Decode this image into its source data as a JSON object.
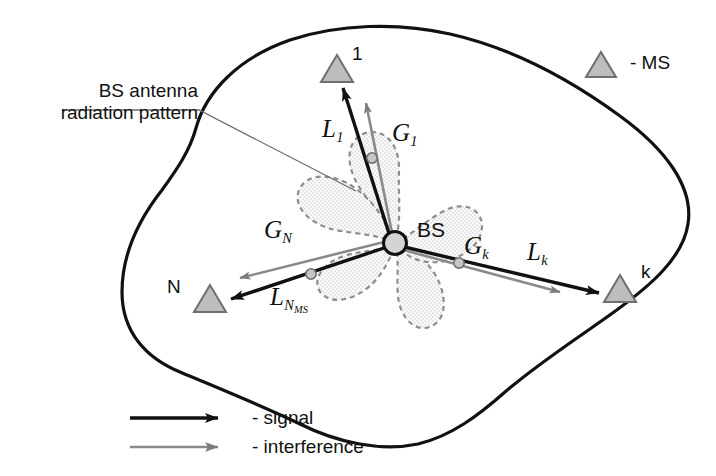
{
  "figure": {
    "background_color": "#ffffff",
    "line_color": "#111111",
    "gray_color": "#808080",
    "fill_gray": "#bdbdbd",
    "pattern_fill": "#f2f2f2"
  },
  "callout": {
    "line1": "BS antenna",
    "line2": "radiation pattern"
  },
  "base_station": {
    "label": "BS",
    "x": 395,
    "y": 243,
    "radius": 11
  },
  "mobile_stations": [
    {
      "id": "1",
      "x": 337,
      "y": 68,
      "label_x": 352,
      "label_y": 48
    },
    {
      "id": "k",
      "x": 620,
      "y": 288,
      "label_x": 640,
      "label_y": 262
    },
    {
      "id": "N",
      "x": 210,
      "y": 298,
      "label_x": 167,
      "label_y": 275
    }
  ],
  "links": [
    {
      "ms": "1",
      "signal_label": "L",
      "signal_sub": "1",
      "signal_sub2": "",
      "interference_label": "G",
      "interference_sub": "1",
      "signal_label_x": 325,
      "signal_label_y": 118,
      "interference_label_x": 394,
      "interference_label_y": 122
    },
    {
      "ms": "k",
      "signal_label": "L",
      "signal_sub": "k",
      "signal_sub2": "",
      "interference_label": "G",
      "interference_sub": "k",
      "signal_label_x": 529,
      "signal_label_y": 241,
      "interference_label_x": 466,
      "interference_label_y": 235
    },
    {
      "ms": "N",
      "signal_label": "L",
      "signal_sub": "N",
      "signal_sub2": "MS",
      "interference_label": "G",
      "interference_sub": "N",
      "signal_label_x": 272,
      "signal_label_y": 286,
      "interference_label_x": 266,
      "interference_label_y": 219
    }
  ],
  "legend": {
    "ms_entry": {
      "icon": "triangle-icon",
      "text": "- MS",
      "x": 596,
      "y": 52
    },
    "items": [
      {
        "icon": "black-arrow-icon",
        "text": "- signal",
        "color": "#111111"
      },
      {
        "icon": "gray-arrow-icon",
        "text": "- interference",
        "color": "#808080"
      }
    ]
  }
}
